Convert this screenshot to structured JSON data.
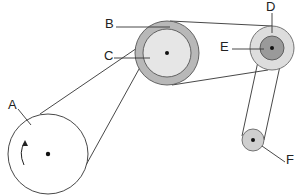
{
  "diagram": {
    "labels": {
      "A": "A",
      "B": "B",
      "C": "C",
      "D": "D",
      "E": "E",
      "F": "F"
    },
    "parts": [
      {
        "id": "A",
        "description": "driving pulley with rotation arrow"
      },
      {
        "id": "B",
        "description": "large grey outer pulley"
      },
      {
        "id": "C",
        "description": "inner pulley on same axle as B"
      },
      {
        "id": "D",
        "description": "light grey outer pulley"
      },
      {
        "id": "E",
        "description": "dark grey inner pulley on same axle as D"
      },
      {
        "id": "F",
        "description": "small idler pulley"
      }
    ],
    "colors": {
      "outline": "#333333",
      "pulley_A_fill": "#ffffff",
      "pulley_B_fill": "#b8b8b8",
      "pulley_C_fill": "#e6e6e6",
      "pulley_D_fill": "#dddddd",
      "pulley_E_fill": "#9a9a9a",
      "pulley_F_fill": "#cfcfcf"
    }
  }
}
